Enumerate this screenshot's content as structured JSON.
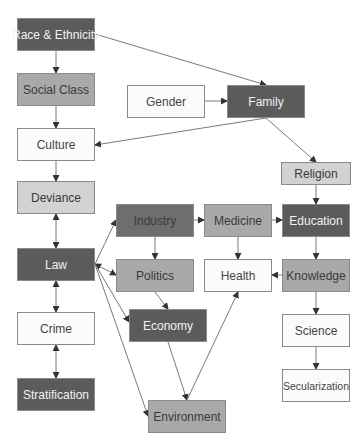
{
  "diagram": {
    "nodes": [
      {
        "id": "race",
        "label": "Race & Ethnicity",
        "x": 17,
        "y": 18,
        "w": 78,
        "h": 33,
        "style": "dark"
      },
      {
        "id": "social",
        "label": "Social Class",
        "x": 17,
        "y": 73,
        "w": 78,
        "h": 33,
        "style": "mid"
      },
      {
        "id": "gender",
        "label": "Gender",
        "x": 127,
        "y": 85,
        "w": 78,
        "h": 33,
        "style": "white"
      },
      {
        "id": "family",
        "label": "Family",
        "x": 227,
        "y": 85,
        "w": 78,
        "h": 33,
        "style": "dark"
      },
      {
        "id": "culture",
        "label": "Culture",
        "x": 17,
        "y": 128,
        "w": 78,
        "h": 33,
        "style": "white"
      },
      {
        "id": "religion",
        "label": "Religion",
        "x": 281,
        "y": 162,
        "w": 70,
        "h": 23,
        "style": "light"
      },
      {
        "id": "deviance",
        "label": "Deviance",
        "x": 17,
        "y": 181,
        "w": 78,
        "h": 33,
        "style": "light"
      },
      {
        "id": "industry",
        "label": "Industry",
        "x": 116,
        "y": 204,
        "w": 78,
        "h": 33,
        "style": "darkmed"
      },
      {
        "id": "medicine",
        "label": "Medicine",
        "x": 204,
        "y": 204,
        "w": 68,
        "h": 33,
        "style": "mid"
      },
      {
        "id": "education",
        "label": "Education",
        "x": 282,
        "y": 204,
        "w": 68,
        "h": 33,
        "style": "dark"
      },
      {
        "id": "law",
        "label": "Law",
        "x": 17,
        "y": 248,
        "w": 78,
        "h": 33,
        "style": "dark"
      },
      {
        "id": "politics",
        "label": "Politics",
        "x": 116,
        "y": 259,
        "w": 78,
        "h": 33,
        "style": "mid"
      },
      {
        "id": "health",
        "label": "Health",
        "x": 204,
        "y": 259,
        "w": 68,
        "h": 33,
        "style": "white"
      },
      {
        "id": "knowledge",
        "label": "Knowledge",
        "x": 282,
        "y": 259,
        "w": 68,
        "h": 33,
        "style": "mid"
      },
      {
        "id": "economy",
        "label": "Economy",
        "x": 129,
        "y": 309,
        "w": 78,
        "h": 33,
        "style": "dark"
      },
      {
        "id": "crime",
        "label": "Crime",
        "x": 17,
        "y": 312,
        "w": 78,
        "h": 33,
        "style": "white"
      },
      {
        "id": "science",
        "label": "Science",
        "x": 282,
        "y": 314,
        "w": 68,
        "h": 33,
        "style": "white"
      },
      {
        "id": "stratification",
        "label": "Stratification",
        "x": 17,
        "y": 378,
        "w": 78,
        "h": 33,
        "style": "dark"
      },
      {
        "id": "secularization",
        "label": "Secularization",
        "x": 282,
        "y": 369,
        "w": 68,
        "h": 33,
        "style": "white",
        "small": true
      },
      {
        "id": "environment",
        "label": "Environment",
        "x": 148,
        "y": 400,
        "w": 78,
        "h": 33,
        "style": "mid"
      }
    ],
    "edges": [
      {
        "from": "race",
        "to": "family",
        "points": [
          [
            95,
            34
          ],
          [
            266,
            85
          ]
        ]
      },
      {
        "from": "race",
        "to": "social",
        "points": [
          [
            56,
            51
          ],
          [
            56,
            73
          ]
        ]
      },
      {
        "from": "social",
        "to": "culture",
        "points": [
          [
            56,
            106
          ],
          [
            56,
            128
          ]
        ]
      },
      {
        "from": "gender",
        "to": "family",
        "points": [
          [
            205,
            101
          ],
          [
            227,
            101
          ]
        ]
      },
      {
        "from": "family",
        "to": "culture",
        "points": [
          [
            266,
            118
          ],
          [
            95,
            145
          ]
        ]
      },
      {
        "from": "family",
        "to": "religion",
        "points": [
          [
            266,
            118
          ],
          [
            316,
            162
          ]
        ]
      },
      {
        "from": "culture",
        "to": "deviance",
        "points": [
          [
            56,
            161
          ],
          [
            56,
            181
          ]
        ]
      },
      {
        "from": "religion",
        "to": "education",
        "points": [
          [
            316,
            185
          ],
          [
            316,
            204
          ]
        ]
      },
      {
        "from": "deviance",
        "to": "law",
        "points": [
          [
            56,
            214
          ],
          [
            56,
            248
          ]
        ],
        "bidirectional": true
      },
      {
        "from": "law",
        "to": "industry",
        "points": [
          [
            95,
            264
          ],
          [
            116,
            220
          ]
        ]
      },
      {
        "from": "law",
        "to": "politics",
        "points": [
          [
            95,
            264
          ],
          [
            116,
            275
          ]
        ],
        "bidirectional": true
      },
      {
        "from": "law",
        "to": "economy",
        "points": [
          [
            95,
            264
          ],
          [
            129,
            322
          ]
        ]
      },
      {
        "from": "law",
        "to": "environment",
        "points": [
          [
            95,
            264
          ],
          [
            148,
            416
          ]
        ]
      },
      {
        "from": "industry",
        "to": "medicine",
        "points": [
          [
            194,
            220
          ],
          [
            204,
            220
          ]
        ]
      },
      {
        "from": "industry",
        "to": "politics",
        "points": [
          [
            155,
            237
          ],
          [
            155,
            259
          ]
        ]
      },
      {
        "from": "medicine",
        "to": "education",
        "points": [
          [
            272,
            220
          ],
          [
            282,
            220
          ]
        ]
      },
      {
        "from": "medicine",
        "to": "health",
        "points": [
          [
            238,
            237
          ],
          [
            238,
            259
          ]
        ]
      },
      {
        "from": "education",
        "to": "knowledge",
        "points": [
          [
            316,
            237
          ],
          [
            316,
            259
          ]
        ]
      },
      {
        "from": "knowledge",
        "to": "health",
        "points": [
          [
            282,
            275
          ],
          [
            272,
            275
          ]
        ]
      },
      {
        "from": "knowledge",
        "to": "science",
        "points": [
          [
            316,
            292
          ],
          [
            316,
            314
          ]
        ]
      },
      {
        "from": "science",
        "to": "secularization",
        "points": [
          [
            316,
            347
          ],
          [
            316,
            369
          ]
        ]
      },
      {
        "from": "politics",
        "to": "economy",
        "points": [
          [
            155,
            292
          ],
          [
            168,
            309
          ]
        ]
      },
      {
        "from": "economy",
        "to": "environment",
        "points": [
          [
            168,
            342
          ],
          [
            187,
            400
          ]
        ]
      },
      {
        "from": "environment",
        "to": "health",
        "points": [
          [
            187,
            400
          ],
          [
            238,
            292
          ]
        ]
      },
      {
        "from": "law",
        "to": "crime",
        "points": [
          [
            56,
            281
          ],
          [
            56,
            312
          ]
        ],
        "bidirectional": true
      },
      {
        "from": "crime",
        "to": "stratification",
        "points": [
          [
            56,
            345
          ],
          [
            56,
            378
          ]
        ],
        "bidirectional": true
      }
    ],
    "colors": {
      "edge": "#7a7a7a",
      "arrowhead": "#333333"
    }
  }
}
